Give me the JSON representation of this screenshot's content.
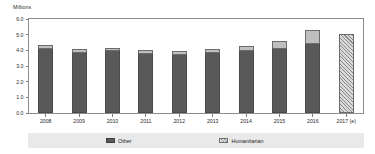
{
  "chart_data": {
    "type": "bar",
    "subtype": "stacked-bar",
    "title": "",
    "xlabel": "",
    "ylabel": "Millions",
    "ylim": [
      0.0,
      6.0
    ],
    "yticks": [
      "0.0",
      "1.0",
      "2.0",
      "3.0",
      "4.0",
      "5.0",
      "6.0"
    ],
    "ytick_values": [
      0.0,
      1.0,
      2.0,
      3.0,
      4.0,
      5.0,
      6.0
    ],
    "grid": false,
    "legend_position": "bottom",
    "categories": [
      "2008",
      "2009",
      "2010",
      "2011",
      "2012",
      "2013",
      "2014",
      "2015",
      "2016",
      "2017 (e)"
    ],
    "series": [
      {
        "name": "Other",
        "values": [
          4.1,
          3.82,
          3.95,
          3.75,
          3.7,
          3.8,
          3.95,
          4.1,
          4.4,
          null
        ]
      },
      {
        "name": "Humanitarian",
        "values": [
          0.25,
          0.26,
          0.2,
          0.28,
          0.28,
          0.28,
          0.33,
          0.5,
          0.9,
          null
        ]
      },
      {
        "name": "2017 (e) total",
        "values": [
          null,
          null,
          null,
          null,
          null,
          null,
          null,
          null,
          null,
          5.05
        ]
      }
    ],
    "totals": [
      4.35,
      4.08,
      4.15,
      4.03,
      3.98,
      4.08,
      4.28,
      4.6,
      5.3,
      5.05
    ],
    "bars": [
      {
        "category": "2008",
        "other": 4.1,
        "humanitarian": 0.25,
        "total": 4.35,
        "estimate": false
      },
      {
        "category": "2009",
        "other": 3.82,
        "humanitarian": 0.26,
        "total": 4.08,
        "estimate": false
      },
      {
        "category": "2010",
        "other": 3.95,
        "humanitarian": 0.2,
        "total": 4.15,
        "estimate": false
      },
      {
        "category": "2011",
        "other": 3.75,
        "humanitarian": 0.28,
        "total": 4.03,
        "estimate": false
      },
      {
        "category": "2012",
        "other": 3.7,
        "humanitarian": 0.28,
        "total": 3.98,
        "estimate": false
      },
      {
        "category": "2013",
        "other": 3.8,
        "humanitarian": 0.28,
        "total": 4.08,
        "estimate": false
      },
      {
        "category": "2014",
        "other": 3.95,
        "humanitarian": 0.33,
        "total": 4.28,
        "estimate": false
      },
      {
        "category": "2015",
        "other": 4.1,
        "humanitarian": 0.5,
        "total": 4.6,
        "estimate": false
      },
      {
        "category": "2016",
        "other": 4.4,
        "humanitarian": 0.9,
        "total": 5.3,
        "estimate": false
      },
      {
        "category": "2017 (e)",
        "other": null,
        "humanitarian": null,
        "total": 5.05,
        "estimate": true
      }
    ],
    "legend": [
      {
        "label": "Other",
        "color": "#595959",
        "pattern": "solid"
      },
      {
        "label": "Humanitarian",
        "color": "#d9d9d9",
        "pattern": "hatched"
      }
    ],
    "colors": {
      "other": "#595959",
      "humanitarian": "#bfbfbf",
      "estimate": "#d6d6d6",
      "frame": "#8d8d8d",
      "legend_background": "#e9e9e9",
      "text": "#2b2b2b"
    }
  }
}
